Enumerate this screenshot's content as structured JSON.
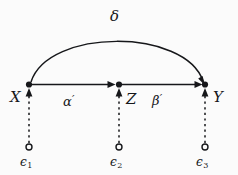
{
  "figure": {
    "type": "path-diagram",
    "title": "",
    "background_color": "#fbfbfb",
    "stroke_color": "#16171a",
    "width": 238,
    "height": 175
  },
  "nodes": [
    {
      "id": "X",
      "label": "X",
      "kind": "observed-variable",
      "marker": "filled-dot",
      "x": 29,
      "y": 85,
      "label_x": 10,
      "label_y": 90
    },
    {
      "id": "Z",
      "label": "Z",
      "kind": "observed-variable",
      "marker": "filled-dot",
      "x": 119,
      "y": 85,
      "label_x": 126,
      "label_y": 92
    },
    {
      "id": "Y",
      "label": "Y",
      "kind": "observed-variable",
      "marker": "filled-dot",
      "x": 205,
      "y": 85,
      "label_x": 213,
      "label_y": 90
    }
  ],
  "errors": [
    {
      "id": "e1",
      "label": "ϵ",
      "subscript": "1",
      "kind": "error-term",
      "marker": "open-circle",
      "x": 29,
      "y": 148,
      "label_x": 20,
      "label_y": 156,
      "target": "X"
    },
    {
      "id": "e2",
      "label": "ϵ",
      "subscript": "2",
      "kind": "error-term",
      "marker": "open-circle",
      "x": 119,
      "y": 148,
      "label_x": 110,
      "label_y": 156,
      "target": "Z"
    },
    {
      "id": "e3",
      "label": "ϵ",
      "subscript": "3",
      "kind": "error-term",
      "marker": "open-circle",
      "x": 205,
      "y": 148,
      "label_x": 196,
      "label_y": 156,
      "target": "Y"
    }
  ],
  "edges": [
    {
      "id": "alpha",
      "from": "X",
      "to": "Z",
      "style": "solid",
      "arrow": "single",
      "label": "α",
      "prime": "′",
      "label_x": 63,
      "label_y": 94
    },
    {
      "id": "beta",
      "from": "Z",
      "to": "Y",
      "style": "solid",
      "arrow": "single",
      "label": "β",
      "prime": "′",
      "label_x": 152,
      "label_y": 93
    },
    {
      "id": "delta",
      "from": "X",
      "to": "Y",
      "style": "solid-arc",
      "arrow": "single",
      "label": "δ",
      "prime": "",
      "label_x": 110,
      "label_y": 9
    },
    {
      "id": "e1-to-X",
      "from": "e1",
      "to": "X",
      "style": "dashed",
      "arrow": "single",
      "label": "",
      "prime": ""
    },
    {
      "id": "e2-to-Z",
      "from": "e2",
      "to": "Z",
      "style": "dashed",
      "arrow": "single",
      "label": "",
      "prime": ""
    },
    {
      "id": "e3-to-Y",
      "from": "e3",
      "to": "Y",
      "style": "dashed",
      "arrow": "single",
      "label": "",
      "prime": ""
    }
  ]
}
